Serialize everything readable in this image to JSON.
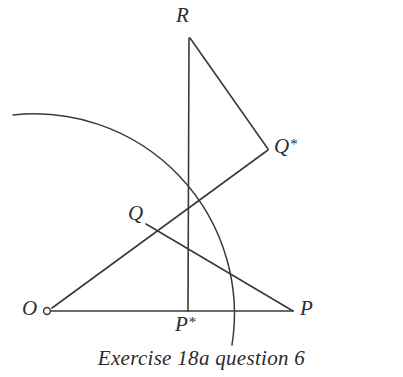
{
  "figure": {
    "caption": "Exercise 18a question 6",
    "stroke_color": "#3a3a3a",
    "background_color": "#ffffff",
    "labels": {
      "R": "R",
      "Q_star": "Q",
      "Q_star_suffix": "*",
      "Q": "Q",
      "O": "O",
      "P_star": "P",
      "P_star_suffix": "*",
      "P": "P"
    }
  },
  "chart_data": {
    "type": "diagram",
    "title": "Exercise 18a question 6",
    "xlim": [
      0,
      403
    ],
    "ylim": [
      0,
      377
    ],
    "grid": false,
    "legend": null,
    "points": [
      {
        "name": "O",
        "x": 47,
        "y": 311,
        "marker": "open-circle",
        "label_pos": "left"
      },
      {
        "name": "P",
        "x": 293,
        "y": 311,
        "marker": "none",
        "label_pos": "right"
      },
      {
        "name": "P*",
        "x": 188,
        "y": 311,
        "marker": "none",
        "label_pos": "below"
      },
      {
        "name": "R",
        "x": 190,
        "y": 38,
        "marker": "none",
        "label_pos": "above"
      },
      {
        "name": "Q",
        "x": 152,
        "y": 231,
        "marker": "none",
        "label_pos": "left"
      },
      {
        "name": "Q*",
        "x": 268,
        "y": 149,
        "marker": "none",
        "label_pos": "right"
      }
    ],
    "segments": [
      {
        "name": "OP",
        "from": "O",
        "to": "P",
        "x1": 50,
        "y1": 311,
        "x2": 293,
        "y2": 311
      },
      {
        "name": "RP*",
        "from": "R",
        "to": "P*",
        "x1": 189,
        "y1": 38,
        "x2": 188,
        "y2": 311
      },
      {
        "name": "RQ*",
        "from": "R",
        "to": "Q*",
        "x1": 190,
        "y1": 38,
        "x2": 268,
        "y2": 149
      },
      {
        "name": "OQ*",
        "from": "O",
        "to": "Q*",
        "x1": 52,
        "y1": 308,
        "x2": 268,
        "y2": 150
      },
      {
        "name": "QP",
        "from": "Q",
        "to": "P",
        "x1": 146,
        "y1": 224,
        "x2": 293,
        "y2": 311
      }
    ],
    "arcs": [
      {
        "name": "circle-arc-centred-at-O",
        "centre": "O",
        "centre_x": 47,
        "centre_y": 311,
        "radius": 200,
        "start_x": 13,
        "start_y": 115,
        "end_x": 232,
        "end_y": 345
      }
    ]
  }
}
